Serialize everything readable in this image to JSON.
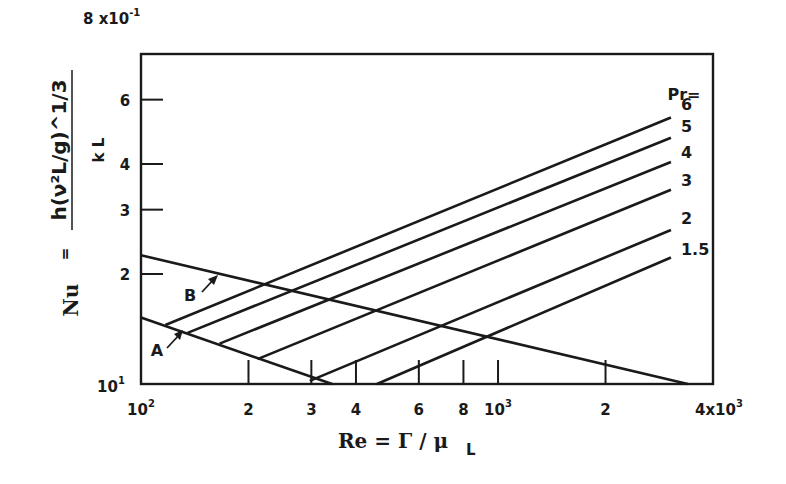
{
  "chart_data": {
    "type": "line",
    "title": "",
    "xlabel": "Re = Γ / μ_L",
    "ylabel": "Nu = h(ν_L² / g)^(1/3) / k_L",
    "xscale": "log",
    "yscale": "log",
    "xlim": [
      100,
      4000
    ],
    "ylim": [
      10,
      80
    ],
    "grid": false,
    "x_ticks": [
      {
        "value": 100,
        "label": "10",
        "sup": "2"
      },
      {
        "value": 200,
        "label": "2"
      },
      {
        "value": 300,
        "label": "3"
      },
      {
        "value": 400,
        "label": "4"
      },
      {
        "value": 600,
        "label": "6"
      },
      {
        "value": 800,
        "label": "8"
      },
      {
        "value": 1000,
        "label": "10",
        "sup": "3"
      },
      {
        "value": 2000,
        "label": "2"
      },
      {
        "value": 4000,
        "label": "4x10",
        "sup": "3"
      }
    ],
    "y_ticks": [
      {
        "value": 10,
        "label": "10",
        "sup": "1"
      },
      {
        "value": 20,
        "label": "2"
      },
      {
        "value": 30,
        "label": "3"
      },
      {
        "value": 40,
        "label": "4"
      },
      {
        "value": 60,
        "label": "6"
      },
      {
        "value": 80,
        "label": "8 x10",
        "sup": "-1"
      }
    ],
    "legend_title": "Pr=",
    "series": [
      {
        "name": "B",
        "x": [
          100,
          3400
        ],
        "y": [
          22.5,
          10
        ]
      },
      {
        "name": "A",
        "x": [
          100,
          343
        ],
        "y": [
          15.2,
          10
        ]
      },
      {
        "name": "Pr=6",
        "x": [
          117,
          3050
        ],
        "y": [
          14.5,
          53.6
        ]
      },
      {
        "name": "Pr=5",
        "x": [
          135,
          3050
        ],
        "y": [
          13.8,
          47.2
        ]
      },
      {
        "name": "Pr=4",
        "x": [
          166,
          3050
        ],
        "y": [
          12.9,
          40.5
        ]
      },
      {
        "name": "Pr=3",
        "x": [
          212,
          3050
        ],
        "y": [
          11.7,
          34.0
        ]
      },
      {
        "name": "Pr=2",
        "x": [
          297,
          3050
        ],
        "y": [
          10.2,
          26.4
        ]
      },
      {
        "name": "Pr=1.5",
        "x": [
          458,
          3050
        ],
        "y": [
          10.0,
          22.2
        ]
      }
    ],
    "annotations": [
      {
        "text": "A",
        "target": "line A"
      },
      {
        "text": "B",
        "target": "line B"
      }
    ],
    "series_labels": [
      "6",
      "5",
      "4",
      "3",
      "2",
      "1.5"
    ]
  },
  "labels": {
    "y_axis_nu": "Nu",
    "y_axis_eq": "=",
    "y_axis_numerator": "h(ν",
    "y_axis_denominator": "k",
    "x_axis_title": "Re = Γ / μ",
    "x_axis_subscript": "L",
    "pr_header": "Pr=",
    "annot_a": "A",
    "annot_b": "B"
  }
}
